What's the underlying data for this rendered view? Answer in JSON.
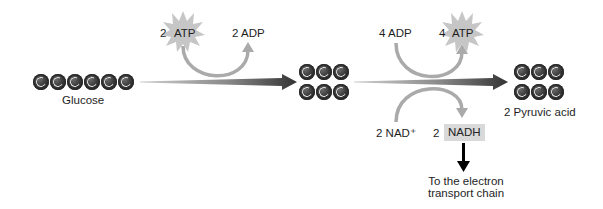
{
  "diagram": {
    "type": "glycolysis-overview",
    "molecules": {
      "glucose": {
        "label": "Glucose",
        "carbons": 6,
        "carbon_symbol": "C"
      },
      "intermediate": {
        "label": "",
        "rows": 2,
        "carbons_per_row": 3,
        "carbon_symbol": "C"
      },
      "pyruvic_acid": {
        "label": "2 Pyruvic acid",
        "rows": 2,
        "carbons_per_row": 3,
        "carbon_symbol": "C"
      }
    },
    "energy_investment": {
      "input_count": "2",
      "input_label": "ATP",
      "output_label": "2 ADP"
    },
    "energy_payoff": {
      "input_label": "4 ADP",
      "output_count": "4",
      "output_label": "ATP"
    },
    "electron_carrier": {
      "input_label": "2 NAD⁺",
      "output_count": "2",
      "output_label": "NADH",
      "destination_label_line1": "To the electron",
      "destination_label_line2": "transport chain"
    },
    "colors": {
      "carbon_dark": "#1a1a1a",
      "arrow_dark": "#333333",
      "arrow_light": "#c8c8c8",
      "curve_gray": "#a9a9a9",
      "star_gray": "#c4c4c4",
      "nadh_highlight": "#d9d9d9",
      "down_arrow": "#000000"
    }
  }
}
